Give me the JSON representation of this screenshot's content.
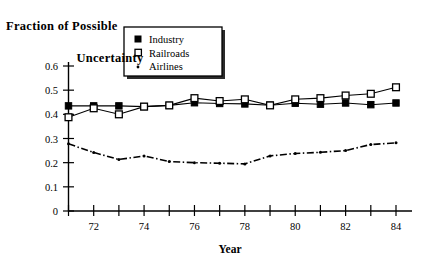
{
  "chart_data": {
    "type": "line",
    "title": "Fraction of Possible Uncertainty",
    "title_line1": "Fraction of Possible",
    "title_line2": "Uncertainty",
    "xlabel": "Year",
    "ylabel": "",
    "xlim": [
      71,
      84
    ],
    "ylim": [
      0,
      0.6
    ],
    "grid": false,
    "legend_position": "top-right",
    "x": [
      71,
      72,
      73,
      74,
      75,
      76,
      77,
      78,
      79,
      80,
      81,
      82,
      83,
      84
    ],
    "x_tick_labels": [
      "72",
      "74",
      "76",
      "78",
      "80",
      "82",
      "84"
    ],
    "x_tick_values": [
      72,
      74,
      76,
      78,
      80,
      82,
      84
    ],
    "y_tick_labels": [
      "0",
      "0.1",
      "0.2",
      "0.3",
      "0.4",
      "0.5",
      "0.6"
    ],
    "y_tick_values": [
      0,
      0.1,
      0.2,
      0.3,
      0.4,
      0.5,
      0.6
    ],
    "series": [
      {
        "name": "Industry",
        "marker": "filled-square",
        "line_style": "solid",
        "values": [
          0.435,
          0.435,
          0.435,
          0.432,
          0.437,
          0.448,
          0.445,
          0.443,
          0.438,
          0.446,
          0.442,
          0.447,
          0.44,
          0.447
        ]
      },
      {
        "name": "Railroads",
        "marker": "open-square",
        "line_style": "solid",
        "values": [
          0.388,
          0.425,
          0.4,
          0.432,
          0.437,
          0.467,
          0.455,
          0.462,
          0.437,
          0.462,
          0.467,
          0.478,
          0.485,
          0.512
        ]
      },
      {
        "name": "Airlines",
        "marker": "dot",
        "line_style": "dash-dot",
        "values": [
          0.278,
          0.242,
          0.213,
          0.228,
          0.205,
          0.2,
          0.198,
          0.195,
          0.228,
          0.238,
          0.243,
          0.25,
          0.275,
          0.282
        ]
      }
    ],
    "legend": [
      {
        "label": "Industry",
        "marker": "filled-square"
      },
      {
        "label": "Railroads",
        "marker": "open-square"
      },
      {
        "label": "Airlines",
        "marker": "dot"
      }
    ]
  }
}
